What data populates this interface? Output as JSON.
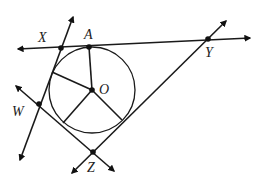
{
  "diagram": {
    "type": "geometry",
    "circle": {
      "center_label": "O"
    },
    "points": {
      "A": {
        "label": "A"
      },
      "X": {
        "label": "X"
      },
      "Y": {
        "label": "Y"
      },
      "W": {
        "label": "W"
      },
      "Z": {
        "label": "Z"
      },
      "O": {
        "label": "O"
      }
    },
    "lines": [
      {
        "name": "line-XY",
        "through": [
          "X",
          "A",
          "Y"
        ],
        "arrows": "both"
      },
      {
        "name": "line-WX",
        "through": [
          "W",
          "X"
        ],
        "arrows": "both"
      },
      {
        "name": "line-WZ",
        "through": [
          "W",
          "Z"
        ],
        "arrows": "both"
      },
      {
        "name": "line-ZY",
        "through": [
          "Z",
          "Y"
        ],
        "arrows": "both"
      }
    ],
    "radii": [
      "OA",
      "O-to-tangent-WX",
      "O-to-tangent-WZ",
      "O-to-tangent-ZY"
    ]
  }
}
